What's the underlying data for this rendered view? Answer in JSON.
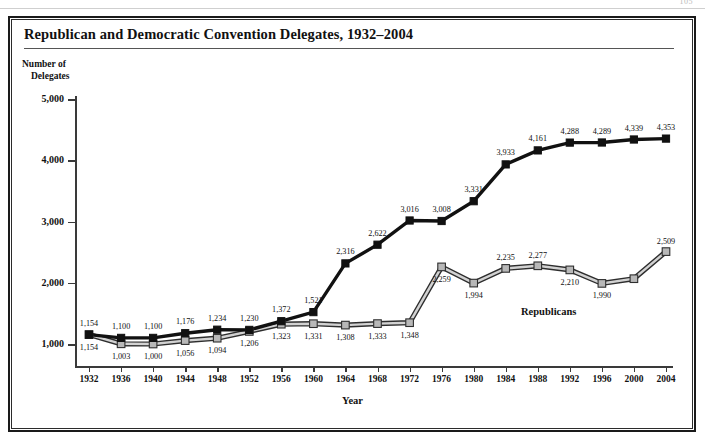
{
  "page": {
    "page_number": "105"
  },
  "chart_title": "Republican and Democratic Convention Delegates, 1932–2004",
  "axis": {
    "ylabel_line1": "Number of",
    "ylabel_line2": "Delegates",
    "xlabel": "Year"
  },
  "legend": {
    "republicans": "Republicans"
  },
  "chart_data": {
    "type": "line",
    "title": "Republican and Democratic Convention Delegates, 1932–2004",
    "xlabel": "Year",
    "ylabel": "Number of Delegates",
    "grid": false,
    "legend_position": "inline-right",
    "ylim": [
      0,
      5000
    ],
    "yticks": [
      1000,
      2000,
      3000,
      4000,
      5000
    ],
    "ytick_labels": [
      "1,000",
      "2,000",
      "3,000",
      "4,000",
      "5,000"
    ],
    "categories": [
      1932,
      1936,
      1940,
      1944,
      1948,
      1952,
      1956,
      1960,
      1964,
      1968,
      1972,
      1976,
      1980,
      1984,
      1988,
      1992,
      1996,
      2000,
      2004
    ],
    "xtick_labels": [
      "1932",
      "1936",
      "1940",
      "1944",
      "1948",
      "1952",
      "1956",
      "1960",
      "1964",
      "1968",
      "1972",
      "1976",
      "1980",
      "1984",
      "1988",
      "1992",
      "1996",
      "2000",
      "2004"
    ],
    "series": [
      {
        "name": "Democrats",
        "color": "#111111",
        "marker": "filled-square",
        "values": [
          1154,
          1100,
          1100,
          1176,
          1234,
          1230,
          1372,
          1521,
          2316,
          2622,
          3016,
          3008,
          3331,
          3933,
          4161,
          4288,
          4289,
          4339,
          4353
        ],
        "labels": [
          "1,154",
          "1,100",
          "1,100",
          "1,176",
          "1,234",
          "1,230",
          "1,372",
          "1,521",
          "2,316",
          "2,622",
          "3,016",
          "3,008",
          "3,331",
          "3,933",
          "4,161",
          "4,288",
          "4,289",
          "4,339",
          "4,353"
        ]
      },
      {
        "name": "Republicans",
        "color": "#b8b8b8",
        "marker": "open-gray-square",
        "values": [
          1154,
          1003,
          1000,
          1056,
          1094,
          1206,
          1323,
          1331,
          1308,
          1333,
          1348,
          2259,
          1994,
          2235,
          2277,
          2210,
          1990,
          2066,
          2509
        ],
        "labels": [
          "1,154",
          "1,003",
          "1,000",
          "1,056",
          "1,094",
          "1,206",
          "1,323",
          "1,331",
          "1,308",
          "1,333",
          "1,348",
          "2,259",
          "1,994",
          "2,235",
          "2,277",
          "2,210",
          "1,990",
          "",
          "2,509"
        ]
      }
    ]
  }
}
